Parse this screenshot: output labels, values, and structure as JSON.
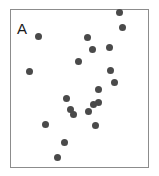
{
  "figure": {
    "width": 159,
    "height": 176,
    "background": "#ffffff"
  },
  "panel": {
    "label": "A",
    "label_x": 17,
    "label_y": 21,
    "label_font_size": 15,
    "label_color": "#1a1a1a"
  },
  "frame": {
    "x": 10,
    "y": 9,
    "width": 139,
    "height": 159,
    "border_color": "#8c8c8c",
    "border_width": 1,
    "fill": "#ffffff"
  },
  "marker": {
    "color": "#4a4a4a",
    "diameter": 7,
    "shape": "circle"
  },
  "chart_data": {
    "type": "scatter",
    "title": "A",
    "xlabel": "",
    "ylabel": "",
    "grid": false,
    "legend": null,
    "axis_ticks": false,
    "axis_tick_labels": false,
    "xlim": [
      0,
      100
    ],
    "ylim": [
      0,
      100
    ],
    "n_points": 21,
    "series": [
      {
        "name": "points",
        "color": "#4a4a4a",
        "marker": "circle",
        "marker_size": 7,
        "points_px": [
          {
            "x": 38,
            "y": 36
          },
          {
            "x": 29,
            "y": 71
          },
          {
            "x": 45,
            "y": 124
          },
          {
            "x": 64,
            "y": 142
          },
          {
            "x": 57,
            "y": 157
          },
          {
            "x": 66,
            "y": 98
          },
          {
            "x": 70,
            "y": 109
          },
          {
            "x": 73,
            "y": 114
          },
          {
            "x": 87,
            "y": 37
          },
          {
            "x": 78,
            "y": 61
          },
          {
            "x": 92,
            "y": 49
          },
          {
            "x": 98,
            "y": 89
          },
          {
            "x": 93,
            "y": 104
          },
          {
            "x": 98,
            "y": 102
          },
          {
            "x": 88,
            "y": 111
          },
          {
            "x": 95,
            "y": 125
          },
          {
            "x": 119,
            "y": 12
          },
          {
            "x": 122,
            "y": 27
          },
          {
            "x": 109,
            "y": 47
          },
          {
            "x": 110,
            "y": 70
          },
          {
            "x": 114,
            "y": 82
          }
        ],
        "x": [
          20.1,
          13.7,
          25.2,
          38.8,
          33.8,
          40.3,
          43.2,
          45.3,
          55.4,
          48.9,
          59.0,
          63.3,
          59.7,
          63.3,
          56.1,
          61.2,
          78.4,
          80.6,
          71.2,
          71.9,
          74.8
        ],
        "y": [
          82.4,
          60.4,
          27.0,
          15.7,
          6.3,
          43.4,
          36.5,
          33.3,
          81.8,
          66.7,
          74.2,
          49.1,
          39.6,
          40.9,
          35.8,
          27.0,
          97.5,
          88.1,
          75.5,
          61.0,
          53.5
        ]
      }
    ]
  }
}
